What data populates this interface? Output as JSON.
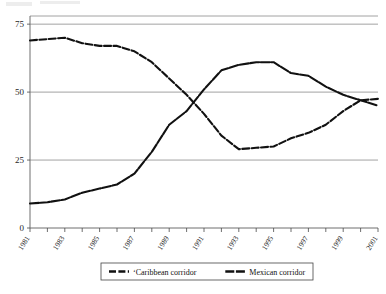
{
  "chart_data": {
    "type": "line",
    "title": "",
    "xlabel": "",
    "ylabel": "",
    "ylim": [
      0,
      78
    ],
    "yticks": [
      0,
      25,
      50,
      75
    ],
    "ytick_labels": [
      "0",
      "25",
      "50",
      "75"
    ],
    "grid": "horizontal",
    "legend_position": "bottom",
    "x": [
      1981,
      1982,
      1983,
      1984,
      1985,
      1986,
      1987,
      1988,
      1989,
      1990,
      1991,
      1992,
      1993,
      1994,
      1995,
      1996,
      1997,
      1998,
      1999,
      2000,
      2001
    ],
    "xtick_labels": [
      "1981",
      "1983",
      "1985",
      "1987",
      "1989",
      "1991",
      "1993",
      "1995",
      "1997",
      "1999",
      "2001"
    ],
    "xtick_years": [
      1981,
      1983,
      1985,
      1987,
      1989,
      1991,
      1993,
      1995,
      1997,
      1999,
      2001
    ],
    "series": [
      {
        "name": "Caribbean corridor",
        "values": [
          69,
          69.5,
          70,
          68,
          67,
          67,
          65,
          61,
          55,
          49,
          42,
          34,
          29,
          29.5,
          30,
          33,
          35,
          38,
          43,
          47,
          47.5
        ]
      },
      {
        "name": "Mexican corridor",
        "values": [
          9,
          9.5,
          10.5,
          13,
          14.5,
          16,
          20,
          28,
          38,
          43,
          51,
          58,
          60,
          61,
          61,
          57,
          56,
          52,
          49,
          47,
          45
        ]
      }
    ]
  },
  "legend": {
    "entries": [
      {
        "label": "Caribbean corridor"
      },
      {
        "label": "Mexican corridor"
      }
    ]
  },
  "axes": {
    "y_tick_0": "0",
    "y_tick_25": "25",
    "y_tick_50": "50",
    "y_tick_75": "75"
  }
}
